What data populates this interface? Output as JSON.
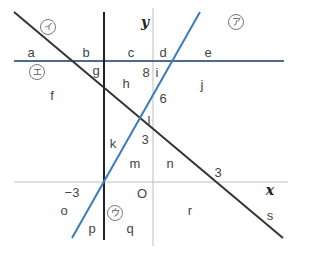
{
  "diagram": {
    "axes": {
      "x_label": "x",
      "y_label": "y",
      "origin_label": "O"
    },
    "lines": [
      {
        "id": "a",
        "mark": "ア",
        "color": "#3a7bbf",
        "description": "blue line with positive slope through (-3,0)"
      },
      {
        "id": "i",
        "mark": "イ",
        "color": "#333333",
        "description": "dark line with negative slope through (3,0)"
      },
      {
        "id": "u",
        "mark": "ウ",
        "color": "#222222",
        "description": "vertical line x = -3"
      },
      {
        "id": "e",
        "mark": "エ",
        "color": "#3a5a80",
        "description": "horizontal line y = 8"
      }
    ],
    "tick_labels": {
      "y8": "8",
      "y6": "6",
      "y3": "3",
      "x3": "3",
      "xneg3": "−3",
      "l": "l"
    },
    "region_labels": [
      "a",
      "b",
      "c",
      "d",
      "e",
      "f",
      "g",
      "h",
      "i",
      "j",
      "k",
      "m",
      "n",
      "o",
      "p",
      "q",
      "r",
      "s"
    ],
    "circled_marks": {
      "a": "ア",
      "i": "イ",
      "u": "ウ",
      "e": "エ"
    }
  },
  "colors": {
    "blue_line": "#3a7bbf",
    "dark_line": "#333333",
    "axis": "#bbbbbb",
    "horizontal": "#4a6a8f"
  }
}
